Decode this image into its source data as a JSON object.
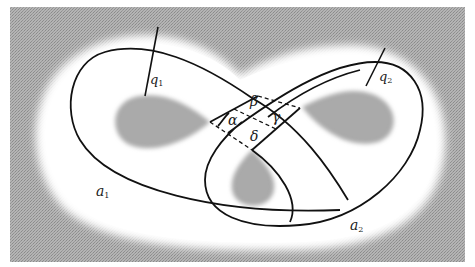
{
  "figure": {
    "colors": {
      "background_gray": "#a9a9a9",
      "surface": "#ffffff",
      "hole_gray": "#a0a0a0",
      "curve": "#111111"
    },
    "labels": {
      "q1": {
        "base": "q",
        "sub": "1"
      },
      "q2": {
        "base": "q",
        "sub": "2"
      },
      "a1": {
        "base": "a",
        "sub": "1"
      },
      "a2": {
        "base": "a",
        "sub": "2"
      },
      "alpha": "α",
      "beta": "β",
      "gamma": "γ",
      "delta": "δ"
    }
  }
}
